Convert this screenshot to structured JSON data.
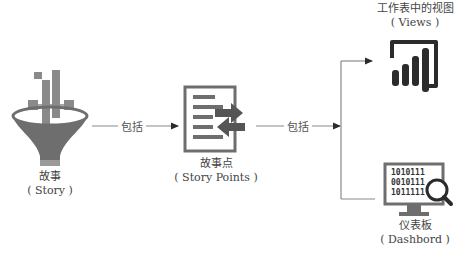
{
  "nodes": {
    "story": {
      "title": "故事",
      "subtitle": "( Story )",
      "icon": "funnel-chart-icon"
    },
    "story_points": {
      "title": "故事点",
      "subtitle": "( Story Points )",
      "icon": "document-arrows-icon"
    },
    "views": {
      "title": "工作表中的视图",
      "subtitle": "( Views )",
      "icon": "bar-chart-icon"
    },
    "dashboard": {
      "title": "仪表板",
      "subtitle": "( Dashbord )",
      "icon": "monitor-search-icon",
      "screen_lines": [
        "1010111",
        "0010111",
        "1011111"
      ]
    }
  },
  "edges": [
    {
      "from": "story",
      "to": "story_points",
      "label": "包括"
    },
    {
      "from": "story_points",
      "to": "views|dashboard",
      "label": "包括"
    }
  ],
  "colors": {
    "line": "#7a7a7a",
    "icon_dark": "#2b2b2b",
    "funnel_gray": "#6e6e6e",
    "bar_gray": "#8a8a8a"
  }
}
